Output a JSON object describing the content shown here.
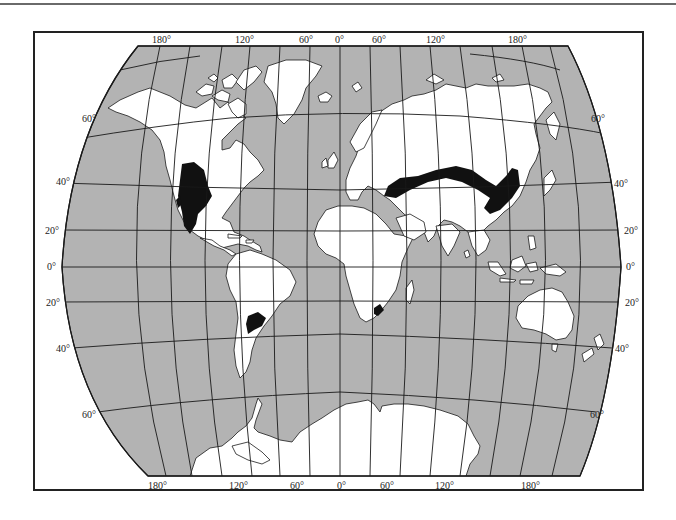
{
  "map": {
    "type": "world-map",
    "projection": "pseudo-cylindrical (curved meridians)",
    "colors": {
      "ocean": "#b3b3b3",
      "land": "#ffffff",
      "highlight_regions": "#111111",
      "graticule": "#1a1a1a",
      "frame": "#222222"
    },
    "top_longitude_labels": [
      "180°",
      "120°",
      "60°",
      "0°",
      "60°",
      "120°",
      "180°"
    ],
    "bottom_longitude_labels": [
      "180°",
      "120°",
      "60°",
      "0°",
      "60°",
      "120°",
      "180°"
    ],
    "left_latitude_labels": [
      "60°",
      "40°",
      "20°",
      "0°",
      "20°",
      "40°",
      "60°"
    ],
    "right_latitude_labels": [
      "60°",
      "40°",
      "20°",
      "0°",
      "20°",
      "40°",
      "60°"
    ],
    "highlighted_regions": [
      "North American Great Plains",
      "Eurasian Steppe",
      "South American Pampas",
      "South African Veld"
    ]
  }
}
